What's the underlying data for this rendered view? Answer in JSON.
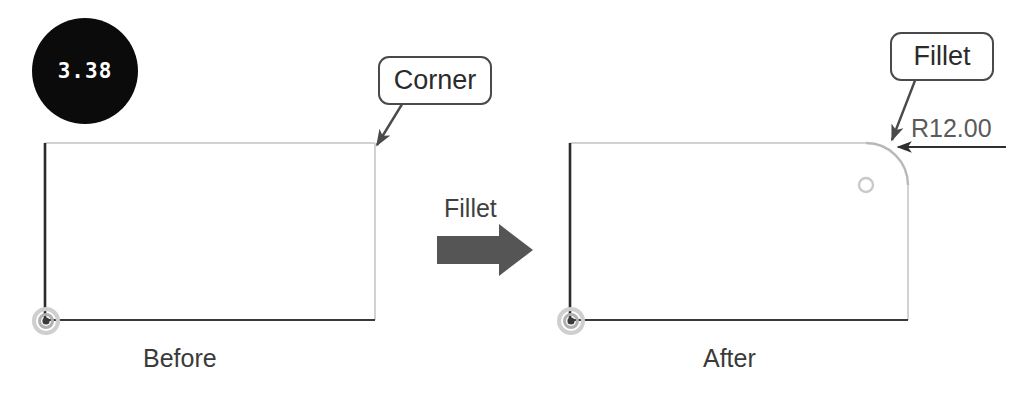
{
  "page": {
    "width": 1012,
    "height": 396,
    "background": "#ffffff"
  },
  "badge": {
    "value": "3.38",
    "fill": "#0b0b0b",
    "text_color": "#ffffff",
    "icon": "filled-circle-badge"
  },
  "callouts": {
    "corner": {
      "label": "Corner",
      "border_color": "#4a4a4a"
    },
    "fillet": {
      "label": "Fillet",
      "border_color": "#4a4a4a"
    }
  },
  "operation": {
    "label": "Fillet",
    "arrow_icon": "block-arrow-right",
    "arrow_color": "#555555"
  },
  "dimension": {
    "label": "R12.00",
    "radius_value": 12.0,
    "prefix": "R",
    "color": "#5a5a5a"
  },
  "stages": {
    "before": {
      "label": "Before",
      "shape": "rectangle-sharp-corner"
    },
    "after": {
      "label": "After",
      "shape": "rectangle-filleted-corner"
    }
  },
  "geometry": {
    "edge_dark_color": "#2b2b2b",
    "edge_light_color": "#cfcfcf",
    "origin_marker_icon": "origin-point-marker",
    "origin_ring_color": "#bfbfbf",
    "origin_center_color": "#3a3a3a",
    "fillet_center_icon": "arc-center-point",
    "fillet_center_color": "#c9c9c9",
    "leader_color": "#4a4a4a"
  }
}
